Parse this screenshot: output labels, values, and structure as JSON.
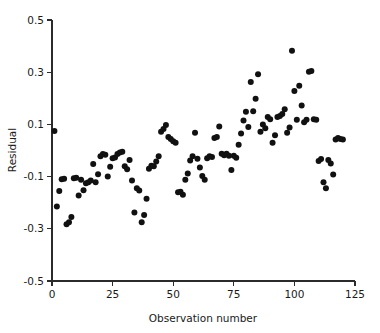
{
  "chart_data": {
    "type": "scatter",
    "title": "",
    "xlabel": "Observation number",
    "ylabel": "Residual",
    "xlim": [
      0,
      125
    ],
    "ylim": [
      -0.5,
      0.5
    ],
    "xticks": [
      0,
      25,
      50,
      75,
      100,
      125
    ],
    "xtick_labels": [
      "0",
      "25",
      "50",
      "75",
      "100",
      "125"
    ],
    "yticks": [
      -0.5,
      -0.3,
      -0.1,
      0.1,
      0.3,
      0.5
    ],
    "ytick_labels": [
      "-0.5",
      "-0.3",
      "-0.1",
      "0.1",
      "0.3",
      "0.5"
    ],
    "grid": false,
    "legend": "none",
    "marker": "filled-circle",
    "marker_color": "#111111",
    "marker_size_px": 3.0,
    "n_points": 120,
    "x": [
      1,
      2,
      3,
      4,
      5,
      6,
      7,
      8,
      9,
      10,
      11,
      12,
      13,
      14,
      15,
      16,
      17,
      18,
      19,
      20,
      21,
      22,
      23,
      24,
      25,
      26,
      27,
      28,
      29,
      30,
      31,
      32,
      33,
      34,
      35,
      36,
      37,
      38,
      39,
      40,
      41,
      42,
      43,
      44,
      45,
      46,
      47,
      48,
      49,
      50,
      51,
      52,
      53,
      54,
      55,
      56,
      57,
      58,
      59,
      60,
      61,
      62,
      63,
      64,
      65,
      66,
      67,
      68,
      69,
      70,
      71,
      72,
      73,
      74,
      75,
      76,
      77,
      78,
      79,
      80,
      81,
      82,
      83,
      84,
      85,
      86,
      87,
      88,
      89,
      90,
      91,
      92,
      93,
      94,
      95,
      96,
      97,
      98,
      99,
      100,
      101,
      102,
      103,
      104,
      105,
      106,
      107,
      108,
      109,
      110,
      111,
      112,
      113,
      114,
      115,
      116,
      117,
      118,
      119,
      120
    ],
    "y": [
      0.075,
      -0.215,
      -0.155,
      -0.11,
      -0.108,
      -0.283,
      -0.275,
      -0.255,
      -0.106,
      -0.104,
      -0.172,
      -0.112,
      -0.152,
      -0.125,
      -0.122,
      -0.115,
      -0.052,
      -0.122,
      -0.091,
      -0.022,
      -0.013,
      -0.016,
      -0.1,
      -0.062,
      -0.03,
      -0.027,
      -0.013,
      -0.008,
      -0.005,
      -0.06,
      -0.072,
      -0.036,
      -0.115,
      -0.238,
      -0.145,
      -0.153,
      -0.275,
      -0.247,
      -0.185,
      -0.07,
      -0.058,
      -0.06,
      -0.042,
      -0.022,
      0.072,
      0.082,
      0.098,
      0.052,
      0.044,
      0.035,
      0.03,
      -0.16,
      -0.158,
      -0.17,
      -0.112,
      -0.088,
      -0.038,
      -0.022,
      0.068,
      -0.032,
      -0.065,
      -0.098,
      -0.112,
      -0.03,
      -0.022,
      -0.025,
      0.048,
      0.052,
      0.092,
      -0.012,
      -0.018,
      -0.012,
      -0.02,
      -0.075,
      -0.02,
      -0.028,
      0.022,
      0.065,
      0.115,
      0.148,
      0.09,
      0.262,
      0.15,
      0.198,
      0.292,
      0.072,
      0.1,
      0.085,
      0.128,
      0.12,
      0.03,
      0.058,
      0.128,
      0.132,
      0.14,
      0.158,
      0.068,
      0.088,
      0.382,
      0.228,
      0.118,
      0.248,
      0.172,
      0.108,
      0.118,
      0.302,
      0.305,
      0.12,
      0.118,
      -0.04,
      -0.033,
      -0.122,
      -0.145,
      -0.036,
      -0.05,
      -0.092,
      0.042,
      0.048,
      0.044,
      0.042
    ]
  },
  "axis": {
    "ylabel_text": "Residual",
    "xlabel_text": "Observation number"
  }
}
